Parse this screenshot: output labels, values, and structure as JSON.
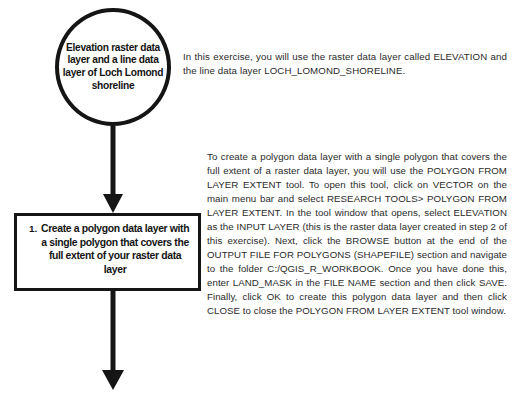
{
  "diagram": {
    "nodes": {
      "start_oval": {
        "shape": "oval",
        "text": "Elevation raster data layer and a line data layer of Loch Lomond shoreline"
      },
      "step_box": {
        "shape": "rectangle",
        "number": "1.",
        "text": "Create a polygon data layer with a single polygon that covers the full extent of your raster data layer"
      }
    },
    "connectors": [
      {
        "name": "arrow-oval-to-box",
        "direction": "down"
      },
      {
        "name": "arrow-box-to-next",
        "direction": "down"
      }
    ]
  },
  "text": {
    "intro": "In this exercise, you will use the raster data layer called ELEVATION and the line data layer LOCH_LOMOND_SHORELINE.",
    "instructions": "To create a polygon data layer with a single polygon that covers the full extent of a raster data layer, you will use the POLYGON FROM LAYER EXTENT tool. To open this tool, click on VECTOR on the main menu bar and select RESEARCH TOOLS> POLYGON FROM LAYER EXTENT. In the tool window that opens, select ELEVATION as the INPUT LAYER (this is the raster data layer created in step 2 of this exercise). Next, click the BROWSE button at the end of the OUTPUT FILE FOR POLYGONS (SHAPEFILE) section and navigate to the folder C:/QGIS_R_WORKBOOK. Once you have done this, enter LAND_MASK in the FILE NAME section and then click SAVE. Finally, click OK to create this polygon data layer and then click CLOSE to close the POLYGON FROM LAYER EXTENT tool window."
  },
  "colors": {
    "background": "#ffffff",
    "stroke": "#151515",
    "body_text": "#2a2a2a",
    "node_text": "#141414"
  }
}
